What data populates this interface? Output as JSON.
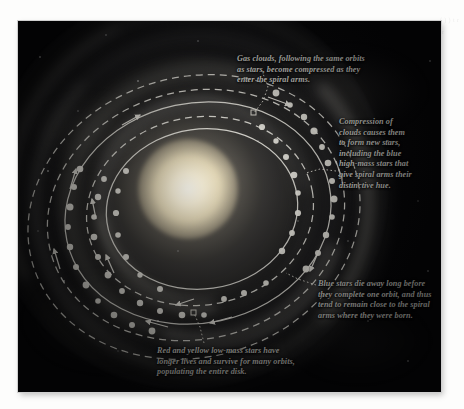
{
  "figure": {
    "medium": "scanned textbook photographic plate"
  },
  "colors": {
    "plate_background": "#060608",
    "caption_text": "#dcdcd6",
    "annotation_line": "#f2f0e8",
    "core_glow": "#fffdf4",
    "page_background": "#fdfdfc"
  },
  "captions": {
    "gas_clouds": "Gas clouds, following the same orbits\nas stars, become compressed as they\nenter the spiral arms.",
    "compression": "Compression of\nclouds causes them\nto form new stars,\nincluding the blue\nhigh-mass stars that\ngive spiral arms their\ndistinctive hue.",
    "blue_stars": "Blue stars die away long before\nthey complete one orbit, and thus\ntend to remain close to the spiral\narms where they were born.",
    "red_yellow_stars": "Red and yellow low-mass stars have\nlonger lives and survive for many orbits,\npopulating the entire disk."
  },
  "diagram": {
    "orbit_rings": [
      {
        "name": "outermost-orbit",
        "style": "dashed",
        "rx": 168,
        "ry": 140,
        "rotation": -16
      },
      {
        "name": "outer-orbit",
        "style": "dashed",
        "rx": 150,
        "ry": 124,
        "rotation": -14
      },
      {
        "name": "middle-orbit",
        "style": "solid",
        "rx": 134,
        "ry": 110,
        "rotation": -12
      },
      {
        "name": "inner-orbit",
        "style": "dashed",
        "rx": 114,
        "ry": 94,
        "rotation": -10
      },
      {
        "name": "innermost-orbit",
        "style": "solid",
        "rx": 96,
        "ry": 80,
        "rotation": -8
      }
    ],
    "ring_legend": {
      "solid": "star orbit",
      "dashed": "gas cloud orbit"
    },
    "star_dot_label": "star",
    "arrow_label": "orbital direction arrow",
    "leader_marker_label": "leader-line anchor"
  },
  "margin_bleed": "( )\n)\nt\nr\nir"
}
